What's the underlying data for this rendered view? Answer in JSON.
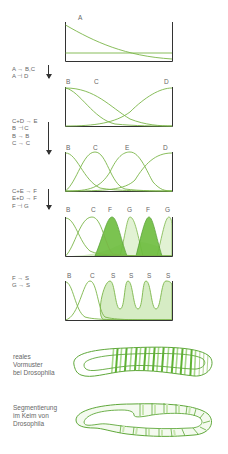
{
  "figure": {
    "panels": [
      {
        "id": "p1",
        "labels": [
          "A"
        ],
        "rules": []
      },
      {
        "id": "p2",
        "labels": [
          "B",
          "C",
          "D"
        ],
        "rules": [
          "A → B,C",
          "A ⊣ D"
        ]
      },
      {
        "id": "p3",
        "labels": [
          "B",
          "C",
          "E",
          "D"
        ],
        "rules": [
          "C+D → E",
          "B ⊣ C",
          "B → B",
          "C → C"
        ]
      },
      {
        "id": "p4",
        "labels": [
          "B",
          "C",
          "F",
          "G",
          "F",
          "G"
        ],
        "rules": [
          "C+E → F",
          "E+D → F",
          "F ⊣ G"
        ]
      },
      {
        "id": "p5",
        "labels": [
          "B",
          "C",
          "S",
          "S",
          "S",
          "S"
        ],
        "rules": [
          "F → S",
          "G → S"
        ]
      }
    ],
    "embryos": [
      {
        "id": "prepattern",
        "caption": [
          "reales",
          "Vormuster",
          "bei Drosophila"
        ]
      },
      {
        "id": "segmentation",
        "caption": [
          "Segmentierung",
          "im Keim von",
          "Drosophila"
        ]
      }
    ],
    "colors": {
      "line": "#7ab648",
      "fill_dark": "#5fb233",
      "fill_light": "#c8e6b0",
      "frame": "#333333"
    }
  }
}
